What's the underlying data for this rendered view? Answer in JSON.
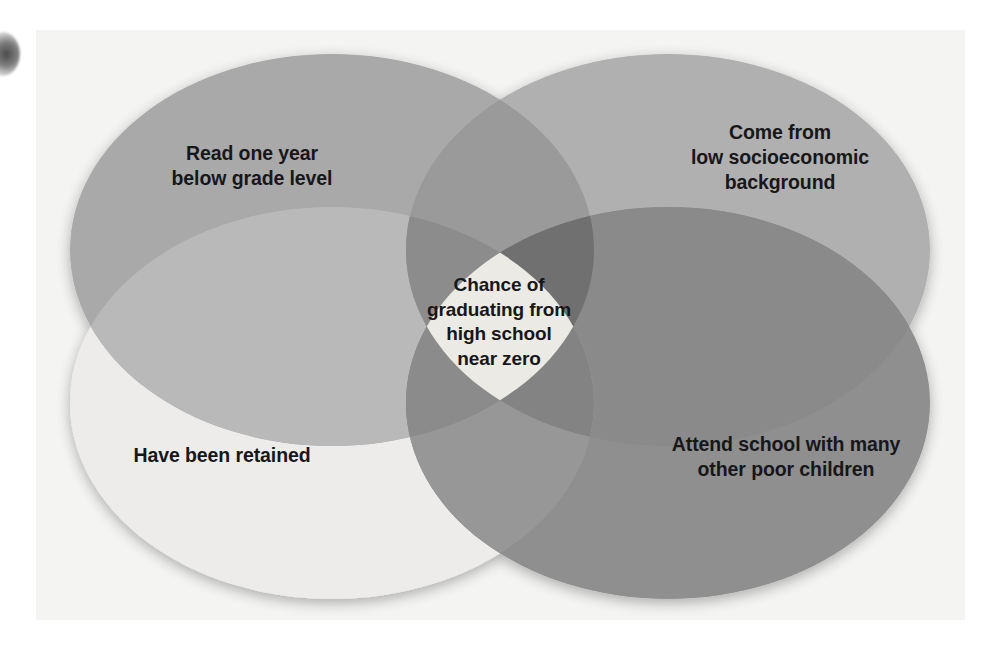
{
  "figure": {
    "type": "venn-diagram",
    "set_count": 4,
    "panel_background": "#f4f4f2",
    "page_background": "#ffffff",
    "text_color": "#17171a"
  },
  "sets": [
    {
      "id": "read-below-grade-level",
      "label": "Read one year\nbelow grade level",
      "position": "top-left",
      "fill": "#a9a9a9"
    },
    {
      "id": "low-socioeconomic-background",
      "label": "Come from\nlow socioeconomic\nbackground",
      "position": "top-right",
      "fill": "#b0b0b0"
    },
    {
      "id": "have-been-retained",
      "label": "Have been retained",
      "position": "bottom-left",
      "fill": "#ededeb"
    },
    {
      "id": "attend-school-many-poor-children",
      "label": "Attend school with many\nother poor children",
      "position": "bottom-right",
      "fill": "#8f8f8f"
    }
  ],
  "center": {
    "id": "all-four-intersection",
    "label": "Chance of\ngraduating from\nhigh school\nnear zero",
    "fill": "#eceae4"
  },
  "overlap_shades": {
    "two_way_light": "#a3a3a3",
    "two_way_medium": "#989898",
    "two_way_dark": "#8a8a8a",
    "three_way": "#7b7b7b",
    "darkest": "#6f6f6f"
  }
}
